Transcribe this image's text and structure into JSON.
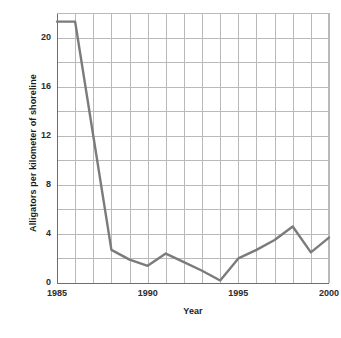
{
  "chart_data": {
    "type": "line",
    "title": "",
    "xlabel": "Year",
    "ylabel": "Alligators per kilometer of shoreline",
    "x": [
      1985,
      1986,
      1987,
      1988,
      1989,
      1990,
      1991,
      1992,
      1993,
      1994,
      1995,
      1996,
      1997,
      1998,
      1999,
      2000
    ],
    "values": [
      21.3,
      21.3,
      12.0,
      2.7,
      1.9,
      1.4,
      2.4,
      1.7,
      1.0,
      0.2,
      2.0,
      2.7,
      3.5,
      4.6,
      2.5,
      3.7
    ],
    "xlim": [
      1985,
      2000
    ],
    "ylim": [
      0,
      22
    ],
    "x_tick_labels": [
      "1985",
      "1990",
      "1995",
      "2000"
    ],
    "x_tick_values": [
      1985,
      1990,
      1995,
      2000
    ],
    "y_tick_labels": [
      "0",
      "4",
      "8",
      "12",
      "16",
      "20"
    ],
    "y_tick_values": [
      0,
      4,
      8,
      12,
      16,
      20
    ],
    "y_gridline_step": 2,
    "x_gridline_step": 1,
    "grid": true,
    "legend": "none",
    "line_color": "#7b7b7b",
    "grid_color": "#b9b9b9",
    "axis_color": "#6e6e6e",
    "background": "#ffffff"
  }
}
